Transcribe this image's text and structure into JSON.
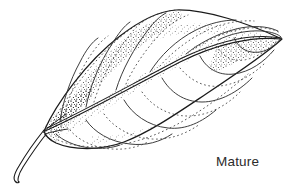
{
  "figure": {
    "kind": "botanical-line-drawing",
    "caption": "Mature",
    "background_color": "#ffffff",
    "ink_color": "#1a1a1a",
    "caption_color": "#2b2b2b",
    "width": 296,
    "height": 196
  },
  "illustration": {
    "outline_stroke": "#1a1a1a",
    "vein_stroke": "#333333",
    "stipple_color": "#2a2a2a",
    "parts": [
      {
        "name": "leaf-blade-outline",
        "label": "Leaf blade"
      },
      {
        "name": "midrib",
        "label": "Midrib"
      },
      {
        "name": "lateral-veins",
        "label": "Lateral veins"
      },
      {
        "name": "petiole",
        "label": "Petiole"
      },
      {
        "name": "stipple-shading",
        "label": "Stipple shading"
      }
    ]
  }
}
